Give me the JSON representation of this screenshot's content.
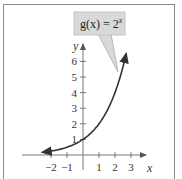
{
  "chart_data": {
    "type": "line",
    "annotation": {
      "label_pre": "g(x) = 2",
      "label_exp": "x",
      "points_to": [
        2.6,
        6.1
      ]
    },
    "xlabel": "x",
    "ylabel": "y",
    "xlim": [
      -2.6,
      3.4
    ],
    "ylim": [
      -0.3,
      7
    ],
    "x_ticks": [
      -2,
      -1,
      1,
      2,
      3
    ],
    "x_tick_labels": [
      "−2",
      "−1",
      "1",
      "2",
      "3"
    ],
    "y_ticks": [
      1,
      2,
      3,
      4,
      5,
      6
    ],
    "y_tick_labels": [
      "1",
      "2",
      "3",
      "4",
      "5",
      "6"
    ],
    "grid": false,
    "series": [
      {
        "name": "g(x) = 2^x",
        "x": [
          -2.5,
          -2,
          -1.5,
          -1,
          -0.5,
          0,
          0.5,
          1,
          1.5,
          2,
          2.5,
          2.7
        ],
        "y": [
          0.177,
          0.25,
          0.354,
          0.5,
          0.707,
          1,
          1.414,
          2,
          2.828,
          4,
          5.657,
          6.5
        ],
        "arrows": "both"
      }
    ],
    "colors": {
      "curve": "#333333",
      "axes": "#777777",
      "callout_fill": "#d9d9d9"
    }
  }
}
